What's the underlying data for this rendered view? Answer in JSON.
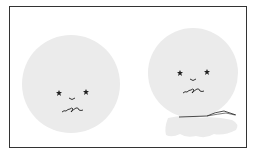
{
  "illustration": {
    "frame_color": "#333333",
    "background_color": "#ffffff",
    "face_fill": "#ebebeb",
    "line_color": "#222222",
    "faces": [
      {
        "name": "left-face",
        "cx": 71,
        "cy": 84,
        "r": 49,
        "eyes": [
          {
            "x": 59,
            "y": 93
          },
          {
            "x": 86,
            "y": 92
          }
        ],
        "nose": {
          "x": 72,
          "y": 98
        },
        "mouth_y": 110,
        "has_scarf": false
      },
      {
        "name": "right-face",
        "cx": 193,
        "cy": 73,
        "r": 45,
        "eyes": [
          {
            "x": 180,
            "y": 73
          },
          {
            "x": 207,
            "y": 72
          }
        ],
        "nose": {
          "x": 193,
          "y": 79
        },
        "mouth_y": 91,
        "has_scarf": true
      }
    ]
  }
}
